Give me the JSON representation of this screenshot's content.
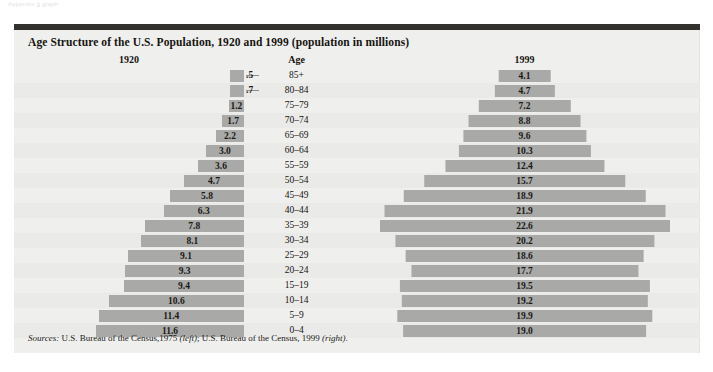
{
  "top_caption": "Appendix g graph",
  "panel": {
    "title": "Age Structure of the U.S. Population, 1920 and 1999 (population in millions)",
    "headers": {
      "left": "1920",
      "middle": "Age",
      "right": "1999"
    },
    "source": {
      "label": "Sources:",
      "text_a": " U.S. Bureau of the Census,1975 ",
      "em_a": "(left)",
      "text_b": "; U.S. Bureau of the Census, 1999 ",
      "em_b": "(right)",
      "text_c": "."
    }
  },
  "colors": {
    "bar": "#a9a9a7",
    "panel_bg": "#efefee",
    "row_alt": "#eaeae8",
    "top_rule": "#33312e",
    "text": "#16140f"
  },
  "chart_data": {
    "type": "bar",
    "title": "Age Structure of the U.S. Population, 1920 and 1999 (population in millions)",
    "subtitle": "",
    "xlabel": "Population (millions)",
    "ylabel": "Age",
    "orientation": "horizontal",
    "layout": "population-pyramid",
    "grid": false,
    "legend": "none",
    "units": "millions of people",
    "categories": [
      "85+",
      "80–84",
      "75–79",
      "70–74",
      "65–69",
      "60–64",
      "55–59",
      "50–54",
      "45–49",
      "40–44",
      "35–39",
      "30–34",
      "25–29",
      "20–24",
      "15–19",
      "10–14",
      "5–9",
      "0–4"
    ],
    "series": [
      {
        "name": "1920",
        "align": "right",
        "values": [
          0.5,
          0.7,
          1.2,
          1.7,
          2.2,
          3.0,
          3.6,
          4.7,
          5.8,
          6.3,
          7.8,
          8.1,
          9.1,
          9.3,
          9.4,
          10.6,
          11.4,
          11.6
        ],
        "labels": [
          ".5",
          ".7",
          "1.2",
          "1.7",
          "2.2",
          "3.0",
          "3.6",
          "4.7",
          "5.8",
          "6.3",
          "7.8",
          "8.1",
          "9.1",
          "9.3",
          "9.4",
          "10.6",
          "11.4",
          "11.6"
        ],
        "label_outside": [
          true,
          true,
          false,
          false,
          false,
          false,
          false,
          false,
          false,
          false,
          false,
          false,
          false,
          false,
          false,
          false,
          false,
          false
        ]
      },
      {
        "name": "1999",
        "align": "center",
        "values": [
          4.1,
          4.7,
          7.2,
          8.8,
          9.6,
          10.3,
          12.4,
          15.7,
          18.9,
          21.9,
          22.6,
          20.2,
          18.6,
          17.7,
          19.5,
          19.2,
          19.9,
          19.0
        ],
        "labels": [
          "4.1",
          "4.7",
          "7.2",
          "8.8",
          "9.6",
          "10.3",
          "12.4",
          "15.7",
          "18.9",
          "21.9",
          "22.6",
          "20.2",
          "18.6",
          "17.7",
          "19.5",
          "19.2",
          "19.9",
          "19.0"
        ],
        "label_outside": [
          false,
          false,
          false,
          false,
          false,
          false,
          false,
          false,
          false,
          false,
          false,
          false,
          false,
          false,
          false,
          false,
          false,
          false
        ]
      }
    ],
    "xlim_left": [
      0,
      11.6
    ],
    "xlim_right": [
      0,
      22.6
    ]
  }
}
